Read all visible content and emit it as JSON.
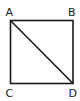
{
  "diagram": {
    "type": "geometry",
    "shape": "square",
    "stroke_color": "#1a1a1a",
    "vertices": [
      {
        "label": "A",
        "position": "top-left"
      },
      {
        "label": "B",
        "position": "top-right"
      },
      {
        "label": "C",
        "position": "bottom-left"
      },
      {
        "label": "D",
        "position": "bottom-right"
      }
    ],
    "segments": [
      "AB",
      "BD",
      "DC",
      "CA",
      "AD"
    ],
    "diagonal": "AD"
  }
}
